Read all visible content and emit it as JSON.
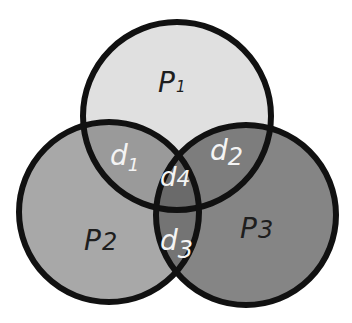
{
  "diagram": {
    "type": "venn",
    "sets": [
      {
        "id": "p1",
        "label": "P",
        "subscript": "1",
        "color": "#e0e0e0",
        "cx": 177,
        "cy": 116,
        "r": 94
      },
      {
        "id": "p2",
        "label": "P",
        "subscript": "2",
        "color": "#a8a8a8",
        "cx": 109,
        "cy": 212,
        "r": 90
      },
      {
        "id": "p3",
        "label": "P",
        "subscript": "3",
        "color": "#858585",
        "cx": 246,
        "cy": 215,
        "r": 90
      }
    ],
    "intersections": [
      {
        "id": "d1",
        "label": "d",
        "subscript": "1",
        "between": [
          "p1",
          "p2"
        ],
        "color": "#9a9a9a"
      },
      {
        "id": "d2",
        "label": "d",
        "subscript": "2",
        "between": [
          "p1",
          "p3"
        ],
        "color": "#7d7d7d"
      },
      {
        "id": "d3",
        "label": "d",
        "subscript": "3",
        "between": [
          "p2",
          "p3"
        ],
        "color": "#747474"
      },
      {
        "id": "d4",
        "label": "d",
        "subscript": "4",
        "between": [
          "p1",
          "p2",
          "p3"
        ],
        "color": "#6a6a6a"
      }
    ],
    "outline_color": "#111111"
  }
}
